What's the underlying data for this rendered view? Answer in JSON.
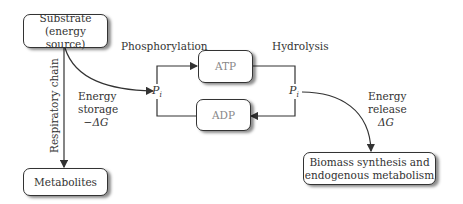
{
  "nodes": {
    "substrate": {
      "line1": "Substrate",
      "line2": "(energy source)"
    },
    "metabolites": {
      "label": "Metabolites"
    },
    "atp": {
      "label": "ATP"
    },
    "adp": {
      "label": "ADP"
    },
    "biomass": {
      "line1": "Biomass synthesis and",
      "line2": "endogenous metabolism"
    }
  },
  "labels": {
    "phosphorylation": "Phosphorylation",
    "hydrolysis": "Hydrolysis",
    "respiratory_chain": "Respiratory chain",
    "energy_storage": {
      "line1": "Energy",
      "line2": "storage",
      "line3": "−ΔG"
    },
    "energy_release": {
      "line1": "Energy",
      "line2": "release",
      "line3": "ΔG"
    },
    "pi_left": {
      "base": "P",
      "sub": "i"
    },
    "pi_right": {
      "base": "P",
      "sub": "i"
    }
  },
  "colors": {
    "line": "#333333",
    "box_border": "#333333",
    "faded_text": "#888888"
  }
}
